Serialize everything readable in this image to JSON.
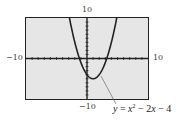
{
  "chart_data": {
    "type": "line",
    "title": "",
    "function": "y = x^2 - 2x - 4",
    "xlim": [
      -10,
      10
    ],
    "ylim": [
      -10,
      10
    ],
    "tick_labels": {
      "x_min": "−10",
      "x_max": "10",
      "y_min": "−10",
      "y_max": "10"
    },
    "grid": false,
    "axis_ticks_every": 1,
    "series": [
      {
        "name": "y = x^2 - 2x - 4",
        "x": [
          -2.87,
          -2,
          -1.24,
          -1,
          0,
          1,
          2,
          3,
          3.24,
          4,
          4.87
        ],
        "y": [
          10,
          4,
          0,
          -1,
          -4,
          -5,
          -4,
          -1,
          0,
          4,
          10
        ]
      }
    ],
    "annotations": [
      {
        "text": "y = x² − 2x − 4",
        "points_to": [
          2.5,
          -2.75
        ]
      }
    ],
    "style": {
      "screen_bg": "#e6e6e6",
      "curve_color": "#222222"
    }
  },
  "labels": {
    "y_max": "10",
    "y_min": "−10",
    "x_min": "−10",
    "x_max": "10",
    "eq_y": "y",
    "eq_eq": " = ",
    "eq_x": "x",
    "eq_exp": "2",
    "eq_rest1": " − 2",
    "eq_x2": "x",
    "eq_rest2": " − 4"
  }
}
